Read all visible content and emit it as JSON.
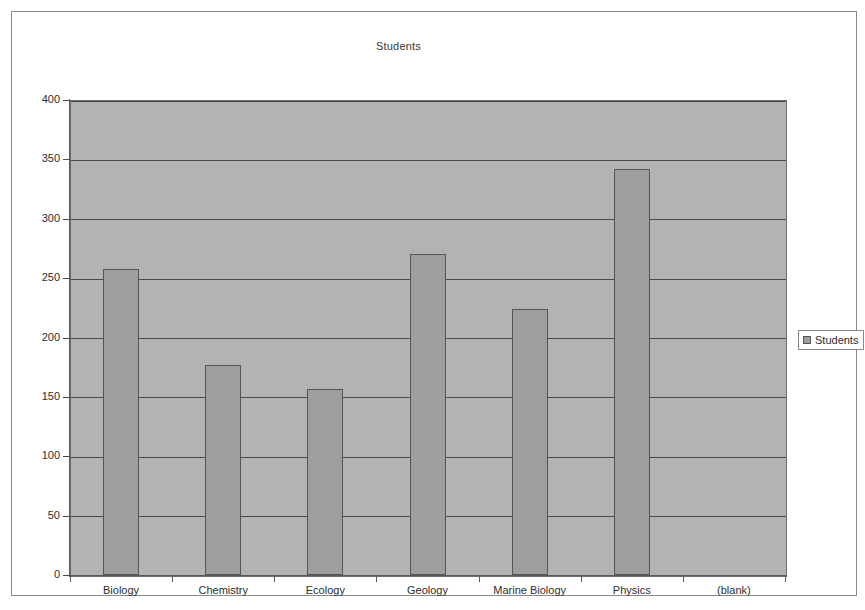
{
  "chart_data": {
    "type": "bar",
    "title": "Students",
    "xlabel": "",
    "ylabel": "",
    "categories": [
      "Biology",
      "Chemistry",
      "Ecology",
      "Geology",
      "Marine Biology",
      "Physics",
      "(blank)"
    ],
    "values": [
      258,
      177,
      157,
      270,
      224,
      342,
      0
    ],
    "series": [
      {
        "name": "Students",
        "values": [
          258,
          177,
          157,
          270,
          224,
          342,
          0
        ]
      }
    ],
    "ylim": [
      0,
      400
    ],
    "yticks": [
      0,
      50,
      100,
      150,
      200,
      250,
      300,
      350,
      400
    ],
    "ytick_labels": [
      "0",
      "50",
      "100",
      "150",
      "200",
      "250",
      "300",
      "350",
      "400"
    ],
    "grid": true,
    "legend_position": "right",
    "legend_entries": [
      "Students"
    ],
    "colors": {
      "bar_fill": "#9e9e9e",
      "bar_border": "#555555",
      "plot_background": "#b3b3b3",
      "gridline": "#4a4a4a",
      "axis": "#5a5a5a",
      "text": "#2e2e2e",
      "frame_border": "#8a8a8a"
    }
  },
  "legend": {
    "marker_icon": "square-swatch-icon",
    "label": "Students"
  }
}
